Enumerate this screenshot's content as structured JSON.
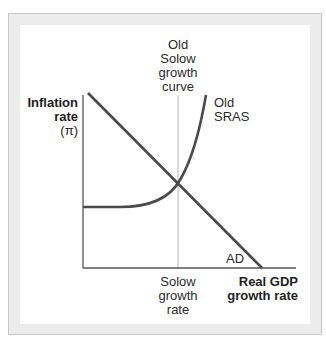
{
  "diagram": {
    "y_axis_label": [
      "Inflation",
      "rate",
      "(π)"
    ],
    "x_axis_label": [
      "Real GDP",
      "growth rate"
    ],
    "solow_curve_label": [
      "Old",
      "Solow",
      "growth",
      "curve"
    ],
    "solow_rate_label": [
      "Solow",
      "growth",
      "rate"
    ],
    "sras_label": [
      "Old",
      "SRAS"
    ],
    "ad_label": "AD",
    "colors": {
      "curve": "#4a4a4a",
      "axis": "#555555",
      "solow_line": "#dadada",
      "frame_border": "#c9c9c9",
      "frame_fill": "#ececec"
    }
  }
}
